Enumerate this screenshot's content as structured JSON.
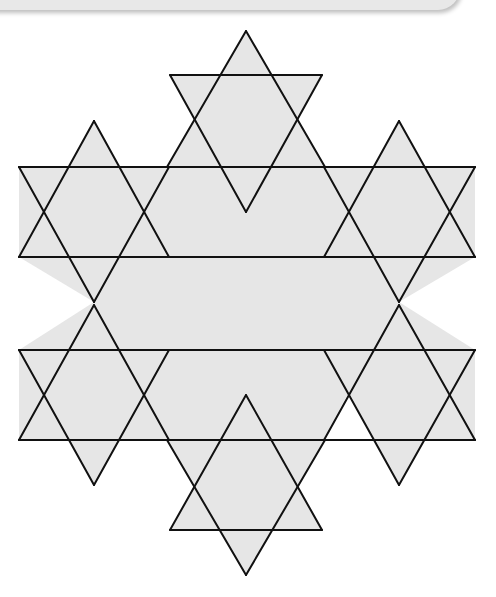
{
  "figure": {
    "fill_color": "#e6e6e6",
    "line_color": "#111111",
    "gap_color": "#ffffff",
    "stars": [
      {
        "name": "top",
        "up": [
          [
            246,
            31
          ],
          [
            167,
            167
          ],
          [
            325,
            167
          ]
        ],
        "down": [
          [
            170,
            75
          ],
          [
            322,
            75
          ],
          [
            246,
            212
          ]
        ]
      },
      {
        "name": "upper-left",
        "up": [
          [
            94,
            121
          ],
          [
            19,
            257
          ],
          [
            169,
            257
          ]
        ],
        "down": [
          [
            19,
            167
          ],
          [
            169,
            167
          ],
          [
            94,
            302
          ]
        ]
      },
      {
        "name": "upper-right",
        "up": [
          [
            399,
            121
          ],
          [
            324,
            257
          ],
          [
            475,
            257
          ]
        ],
        "down": [
          [
            324,
            167
          ],
          [
            475,
            167
          ],
          [
            399,
            302
          ]
        ]
      },
      {
        "name": "lower-left",
        "up": [
          [
            94,
            305
          ],
          [
            19,
            440
          ],
          [
            169,
            440
          ]
        ],
        "down": [
          [
            19,
            350
          ],
          [
            169,
            350
          ],
          [
            94,
            485
          ]
        ]
      },
      {
        "name": "lower-right",
        "up": [
          [
            399,
            305
          ],
          [
            324,
            440
          ],
          [
            475,
            440
          ]
        ],
        "down": [
          [
            324,
            350
          ],
          [
            475,
            350
          ],
          [
            399,
            485
          ]
        ]
      },
      {
        "name": "bottom",
        "up": [
          [
            246,
            395
          ],
          [
            170,
            530
          ],
          [
            322,
            530
          ]
        ],
        "down": [
          [
            167,
            440
          ],
          [
            325,
            440
          ],
          [
            246,
            575
          ]
        ]
      }
    ],
    "inner_fill": [
      [
        19,
        167
      ],
      [
        475,
        167
      ],
      [
        475,
        257
      ],
      [
        475,
        350
      ],
      [
        475,
        440
      ],
      [
        19,
        440
      ]
    ],
    "white_gap": [
      [
        349,
        392
      ],
      [
        323,
        440
      ],
      [
        374,
        440
      ]
    ],
    "lines": [
      [
        [
          170,
          75
        ],
        [
          322,
          75
        ]
      ],
      [
        [
          19,
          167
        ],
        [
          475,
          167
        ]
      ],
      [
        [
          19,
          257
        ],
        [
          475,
          257
        ]
      ],
      [
        [
          19,
          350
        ],
        [
          475,
          350
        ]
      ],
      [
        [
          19,
          440
        ],
        [
          475,
          440
        ]
      ],
      [
        [
          170,
          530
        ],
        [
          322,
          530
        ]
      ],
      [
        [
          246,
          31
        ],
        [
          94,
          302
        ]
      ],
      [
        [
          246,
          31
        ],
        [
          399,
          302
        ]
      ],
      [
        [
          94,
          121
        ],
        [
          246,
          392
        ]
      ],
      [
        [
          399,
          121
        ],
        [
          246,
          392
        ]
      ],
      [
        [
          94,
          121
        ],
        [
          19,
          257
        ]
      ],
      [
        [
          399,
          121
        ],
        [
          475,
          257
        ]
      ],
      [
        [
          170,
          75
        ],
        [
          399,
          485
        ]
      ],
      [
        [
          322,
          75
        ],
        [
          94,
          485
        ]
      ],
      [
        [
          19,
          167
        ],
        [
          246,
          575
        ]
      ],
      [
        [
          475,
          167
        ],
        [
          246,
          575
        ]
      ],
      [
        [
          94,
          302
        ],
        [
          19,
          440
        ]
      ],
      [
        [
          399,
          302
        ],
        [
          475,
          440
        ]
      ],
      [
        [
          94,
          302
        ],
        [
          246,
          575
        ]
      ],
      [
        [
          399,
          302
        ],
        [
          246,
          575
        ]
      ],
      [
        [
          19,
          350
        ],
        [
          94,
          485
        ]
      ],
      [
        [
          475,
          350
        ],
        [
          399,
          485
        ]
      ],
      [
        [
          94,
          305
        ],
        [
          246,
          575
        ]
      ],
      [
        [
          399,
          305
        ],
        [
          246,
          575
        ]
      ]
    ]
  }
}
